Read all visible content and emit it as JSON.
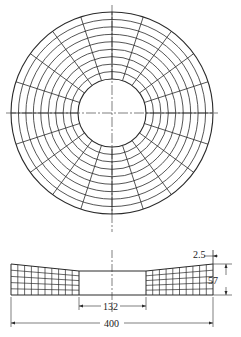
{
  "figure": {
    "type": "annular-disk-fe-mesh",
    "top_view": {
      "radial_divisions": 20,
      "ring_lines": 10
    },
    "section_view": {
      "columns_per_side": 10,
      "rows": 5
    },
    "dimensions": {
      "outer_diameter": "400",
      "inner_diameter": "132",
      "thickness": "57",
      "offset": "2.5"
    },
    "colors": {
      "line": "#2a2a2a",
      "background": "#ffffff"
    }
  }
}
